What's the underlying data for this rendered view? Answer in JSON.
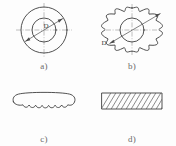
{
  "figure": {
    "type": "engineering-drawing",
    "background_color": "#fdfdfd",
    "line_color": "#3d3d3d",
    "centerline_color": "#8d8d8d",
    "caption_color": "#6a6a6a"
  },
  "panels": [
    {
      "key": "a",
      "caption": "a)",
      "shape": "annular-ring",
      "dimension_label": "D",
      "outer_circle": {
        "cx": 44,
        "cy": 30,
        "r": 23
      },
      "inner_circle": {
        "cx": 44,
        "cy": 30,
        "r": 12
      },
      "centerlines": [
        "horizontal",
        "vertical"
      ],
      "dimension_line": {
        "angle_deg": -30,
        "arrows": "both"
      }
    },
    {
      "key": "b",
      "caption": "b)",
      "shape": "gear-wheel",
      "dimension_label": "D",
      "teeth": 12,
      "pitch_circle": {
        "cx": 44,
        "cy": 30,
        "r": 21
      },
      "root_circle": {
        "cx": 44,
        "cy": 30,
        "r": 16
      },
      "bore_circle": {
        "cx": 44,
        "cy": 30,
        "r": 12
      },
      "centerlines": [
        "horizontal",
        "vertical"
      ],
      "dimension_line": {
        "angle_deg": -30,
        "arrows": "both"
      }
    },
    {
      "key": "c",
      "caption": "c)",
      "shape": "curved-scalloped-segment",
      "scallops": 6,
      "orientation": "arched"
    },
    {
      "key": "d",
      "caption": "d)",
      "shape": "hatched-rectangle-section",
      "hatch_lines": 13,
      "hatch_direction": "up-right",
      "rect": {
        "x": 14,
        "y": 20,
        "width": 60,
        "height": 16
      }
    }
  ]
}
